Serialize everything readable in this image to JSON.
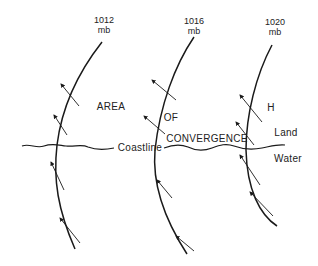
{
  "diagram": {
    "isobars": [
      {
        "label_value": "1012",
        "label_unit": "mb"
      },
      {
        "label_value": "1016",
        "label_unit": "mb"
      },
      {
        "label_value": "1020",
        "label_unit": "mb"
      }
    ],
    "labels": {
      "area": "AREA",
      "of": "OF",
      "convergence": "CONVERGENCE",
      "high": "H",
      "land": "Land",
      "water": "Water",
      "coastline": "Coastline"
    },
    "colors": {
      "line": "#1a1a1a",
      "text": "#222222",
      "background": "#ffffff"
    }
  }
}
